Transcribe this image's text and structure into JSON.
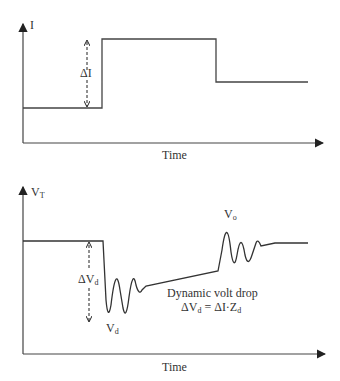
{
  "top_plot": {
    "y_axis_label": "I",
    "x_axis_label": "Time",
    "delta_label": "ΔI"
  },
  "bottom_plot": {
    "y_axis_label": "V",
    "y_axis_label_sub": "T",
    "x_axis_label": "Time",
    "delta_label": "ΔV",
    "delta_label_sub": "d",
    "vd_label": "V",
    "vd_label_sub": "d",
    "vo_label": "V",
    "vo_label_sub": "o",
    "annotation_line1": "Dynamic volt drop",
    "annotation_line2_a": "ΔV",
    "annotation_line2_a_sub": "d",
    "annotation_line2_b": " = ΔI·Z",
    "annotation_line2_b_sub": "d"
  },
  "colors": {
    "line": "#444444",
    "text": "#333333"
  }
}
